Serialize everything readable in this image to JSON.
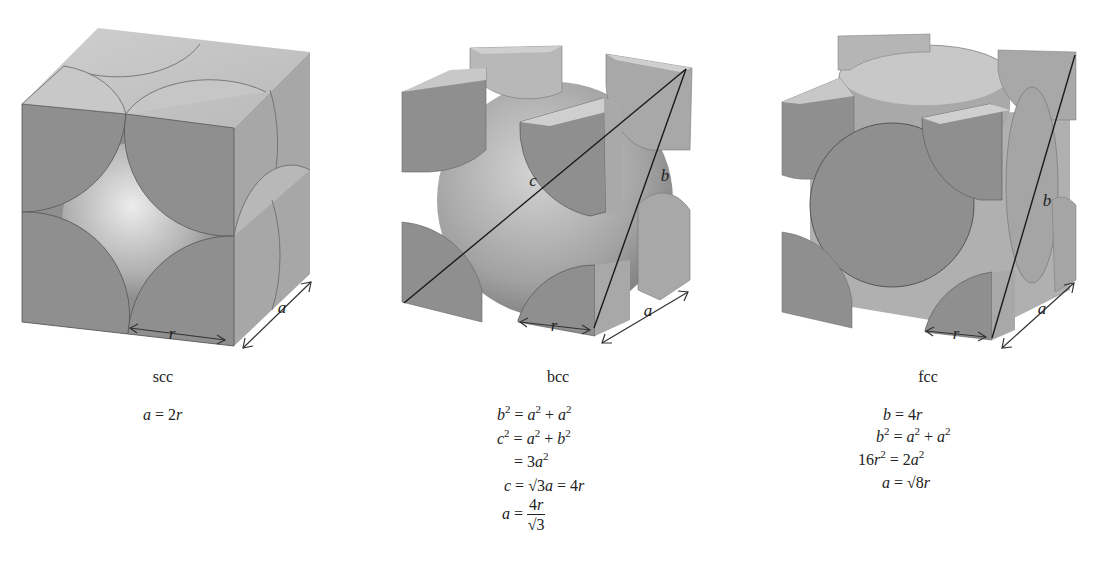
{
  "figure": {
    "panels": [
      {
        "id": "scc",
        "caption": "scc",
        "dimension_labels": {
          "r": "r",
          "a": "a"
        },
        "equations": [
          "a = 2r"
        ]
      },
      {
        "id": "bcc",
        "caption": "bcc",
        "dimension_labels": {
          "r": "r",
          "a": "a",
          "b": "b",
          "c": "c"
        },
        "equations": [
          "b² = a² + a²",
          "c² = a² + b²",
          "= 3a²",
          "c = √3a = 4r",
          "a = 4r / √3"
        ]
      },
      {
        "id": "fcc",
        "caption": "fcc",
        "dimension_labels": {
          "r": "r",
          "a": "a",
          "b": "b"
        },
        "equations": [
          "b = 4r",
          "b² = a² + a²",
          "16r² = 2a²",
          "a = √8r"
        ]
      }
    ],
    "colors": {
      "front_face": "#8f8f8f",
      "top_face": "#c4c4c4",
      "side_face": "#a9a9a9",
      "sphere_light": "#e6e6e6",
      "sphere_dark": "#8a8a8a",
      "line": "#1a1a1a",
      "background": "#ffffff"
    }
  }
}
